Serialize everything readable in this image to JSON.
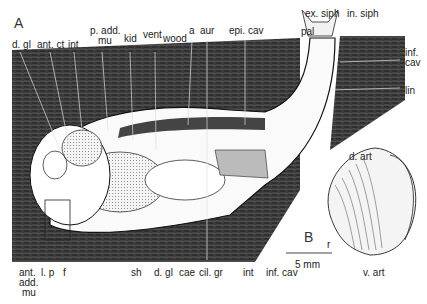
{
  "figure": {
    "panel_a": "A",
    "panel_b": "B",
    "scale_bar": "5 mm",
    "labels_top": [
      {
        "text": "d. gl",
        "x": 12,
        "y": 40
      },
      {
        "text": "ant. ct",
        "x": 37,
        "y": 40
      },
      {
        "text": "int",
        "x": 68,
        "y": 40
      },
      {
        "text": "p. add.",
        "x": 90,
        "y": 26
      },
      {
        "text": "mu",
        "x": 98,
        "y": 36
      },
      {
        "text": "kid",
        "x": 124,
        "y": 34
      },
      {
        "text": "vent",
        "x": 143,
        "y": 30
      },
      {
        "text": "wood",
        "x": 163,
        "y": 34
      },
      {
        "text": "a",
        "x": 189,
        "y": 26
      },
      {
        "text": "aur",
        "x": 200,
        "y": 26
      },
      {
        "text": "epi. cav",
        "x": 229,
        "y": 26
      },
      {
        "text": "ex. siph",
        "x": 305,
        "y": 9
      },
      {
        "text": "in. siph",
        "x": 347,
        "y": 9
      },
      {
        "text": "pal",
        "x": 301,
        "y": 27
      },
      {
        "text": "inf.",
        "x": 405,
        "y": 48
      },
      {
        "text": "cav",
        "x": 405,
        "y": 58
      },
      {
        "text": "lin",
        "x": 405,
        "y": 86
      }
    ],
    "labels_bottom": [
      {
        "text": "ant.",
        "x": 19,
        "y": 268
      },
      {
        "text": "add.",
        "x": 19,
        "y": 278
      },
      {
        "text": "mu",
        "x": 22,
        "y": 288
      },
      {
        "text": "l. p",
        "x": 41,
        "y": 268
      },
      {
        "text": "f",
        "x": 63,
        "y": 268
      },
      {
        "text": "sh",
        "x": 131,
        "y": 268
      },
      {
        "text": "d. gl",
        "x": 154,
        "y": 268
      },
      {
        "text": "cae",
        "x": 179,
        "y": 268
      },
      {
        "text": "cil. gr",
        "x": 199,
        "y": 268
      },
      {
        "text": "int",
        "x": 243,
        "y": 268
      },
      {
        "text": "inf. cav",
        "x": 266,
        "y": 268
      },
      {
        "text": "d. art",
        "x": 349,
        "y": 152
      },
      {
        "text": "r",
        "x": 327,
        "y": 240
      },
      {
        "text": "v. art",
        "x": 363,
        "y": 268
      }
    ]
  }
}
